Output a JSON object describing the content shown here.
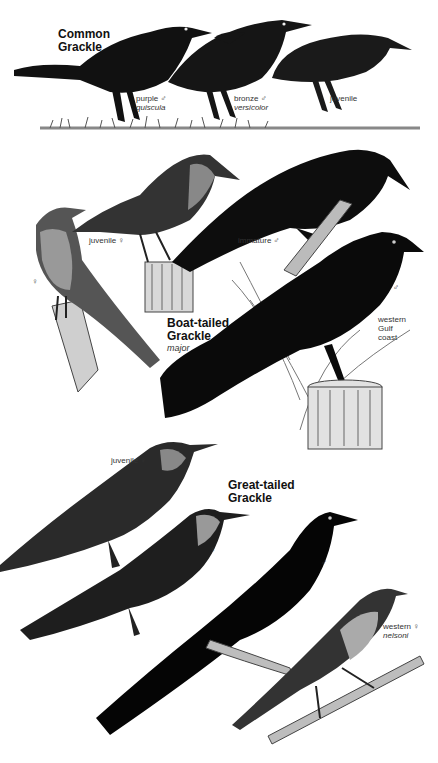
{
  "plate": {
    "species": [
      {
        "name_line1": "Common",
        "name_line2": "Grackle",
        "forms": [
          {
            "label": "purple ♂",
            "subspecies": "quiscula"
          },
          {
            "label": "bronze ♂",
            "subspecies": "versicolor"
          },
          {
            "label": "juvenile",
            "subspecies": ""
          }
        ]
      },
      {
        "name_line1": "Boat-tailed",
        "name_line2": "Grackle",
        "subspecies": "major",
        "forms": [
          {
            "label": "juvenile ♀"
          },
          {
            "label": "immature ♂"
          },
          {
            "label": "♀"
          },
          {
            "label": "♂"
          },
          {
            "label_line1": "western",
            "label_line2": "Gulf",
            "label_line3": "coast"
          }
        ]
      },
      {
        "name_line1": "Great-tailed",
        "name_line2": "Grackle",
        "forms": [
          {
            "label": "juvenile ♀"
          },
          {
            "label": "♀"
          },
          {
            "label": "♂"
          },
          {
            "label": "western ♀",
            "subspecies": "nelsoni"
          }
        ]
      }
    ]
  }
}
